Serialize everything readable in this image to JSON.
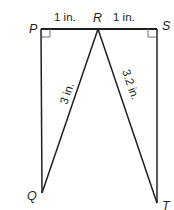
{
  "diagram": {
    "type": "geometry-figure",
    "points": {
      "P": {
        "label": "P",
        "x": 41,
        "y": 29
      },
      "R": {
        "label": "R",
        "x": 98,
        "y": 29
      },
      "S": {
        "label": "S",
        "x": 157,
        "y": 29
      },
      "Q": {
        "label": "Q",
        "x": 42,
        "y": 193
      },
      "T": {
        "label": "T",
        "x": 157,
        "y": 203
      }
    },
    "segments": [
      {
        "from": "P",
        "to": "R",
        "length_label": "1 in."
      },
      {
        "from": "R",
        "to": "S",
        "length_label": "1 in."
      },
      {
        "from": "R",
        "to": "Q",
        "length_label": "3 in."
      },
      {
        "from": "R",
        "to": "T",
        "length_label": "3.2 in."
      },
      {
        "from": "P",
        "to": "Q",
        "length_label": ""
      },
      {
        "from": "S",
        "to": "T",
        "length_label": ""
      }
    ],
    "right_angles": [
      "P",
      "S"
    ],
    "labels": {
      "pr": "1 in.",
      "rs": "1 in.",
      "rq": "3 in.",
      "rt": "3.2 in."
    },
    "colors": {
      "stroke": "#231f20",
      "right_angle_mark": "#6d6e71"
    }
  }
}
